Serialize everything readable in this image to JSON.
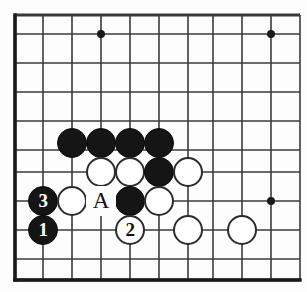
{
  "diagram": {
    "type": "go-board-problem",
    "board": {
      "width": 307,
      "height": 292,
      "line_color": "#3a3a3a",
      "border_color": "#1a1a1a",
      "background_color": "#fdfdfd",
      "x_lines": [
        15,
        43,
        72,
        101,
        130,
        159,
        188,
        213,
        242,
        271,
        300
      ],
      "y_lines": [
        15,
        34,
        63,
        92,
        121,
        150,
        172,
        201,
        230,
        259,
        280
      ],
      "edges": {
        "left": 15,
        "top": 15,
        "bottom": 280,
        "right": 300
      },
      "star_points": [
        {
          "x": 101,
          "y": 34
        },
        {
          "x": 271,
          "y": 34
        },
        {
          "x": 271,
          "y": 201
        }
      ],
      "stone_radius": 15
    },
    "stones": [
      {
        "id": "b-a",
        "color": "black",
        "x": 72,
        "y": 143,
        "label": ""
      },
      {
        "id": "b-b",
        "color": "black",
        "x": 101,
        "y": 143,
        "label": ""
      },
      {
        "id": "b-c",
        "color": "black",
        "x": 130,
        "y": 143,
        "label": ""
      },
      {
        "id": "b-d",
        "color": "black",
        "x": 159,
        "y": 143,
        "label": ""
      },
      {
        "id": "w-a",
        "color": "white",
        "x": 101,
        "y": 172,
        "label": ""
      },
      {
        "id": "w-b",
        "color": "white",
        "x": 130,
        "y": 172,
        "label": ""
      },
      {
        "id": "b-e",
        "color": "black",
        "x": 159,
        "y": 172,
        "label": ""
      },
      {
        "id": "w-c",
        "color": "white",
        "x": 188,
        "y": 172,
        "label": ""
      },
      {
        "id": "b-move3",
        "color": "black",
        "x": 43,
        "y": 201,
        "label": "3"
      },
      {
        "id": "w-d",
        "color": "white",
        "x": 72,
        "y": 201,
        "label": ""
      },
      {
        "id": "b-f",
        "color": "black",
        "x": 130,
        "y": 201,
        "label": ""
      },
      {
        "id": "w-e",
        "color": "white",
        "x": 159,
        "y": 201,
        "label": ""
      },
      {
        "id": "b-move1",
        "color": "black",
        "x": 43,
        "y": 230,
        "label": "1"
      },
      {
        "id": "w-move2",
        "color": "white",
        "x": 130,
        "y": 230,
        "label": "2"
      },
      {
        "id": "w-f",
        "color": "white",
        "x": 188,
        "y": 230,
        "label": ""
      },
      {
        "id": "w-g",
        "color": "white",
        "x": 242,
        "y": 230,
        "label": ""
      }
    ],
    "point_labels": [
      {
        "id": "label-A",
        "text": "A",
        "x": 101,
        "y": 201
      }
    ]
  }
}
